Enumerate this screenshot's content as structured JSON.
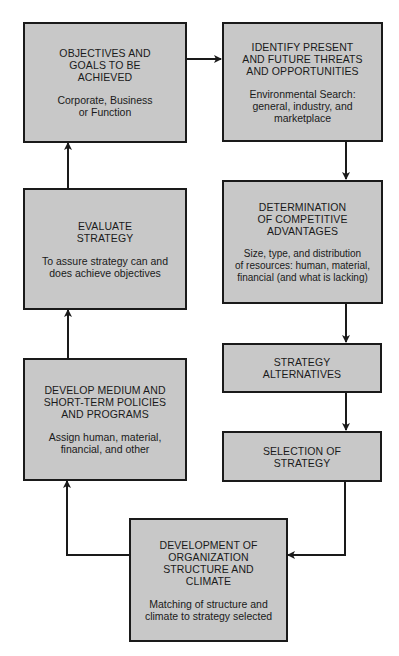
{
  "diagram": {
    "type": "flowchart",
    "colors": {
      "box_fill": "#c8c8c8",
      "stroke": "#1a1a1a",
      "background": "#ffffff"
    },
    "nodes": [
      {
        "id": "objectives",
        "title": "OBJECTIVES AND\nGOALS TO BE\nACHIEVED",
        "description": "Corporate, Business\nor Function"
      },
      {
        "id": "identify",
        "title": "IDENTIFY PRESENT\nAND FUTURE THREATS\nAND OPPORTUNITIES",
        "description": "Environmental Search:\ngeneral, industry, and\nmarketplace"
      },
      {
        "id": "determination",
        "title": "DETERMINATION\nOF COMPETITIVE\nADVANTAGES",
        "description": "Size, type, and distribution\nof resources: human, material,\nfinancial (and what is lacking)"
      },
      {
        "id": "alternatives",
        "title": "STRATEGY\nALTERNATIVES",
        "description": ""
      },
      {
        "id": "selection",
        "title": "SELECTION OF\nSTRATEGY",
        "description": ""
      },
      {
        "id": "organization",
        "title": "DEVELOPMENT OF\nORGANIZATION\nSTRUCTURE AND\nCLIMATE",
        "description": "Matching of structure and\nclimate to strategy selected"
      },
      {
        "id": "policies",
        "title": "DEVELOP MEDIUM AND\nSHORT-TERM POLICIES\nAND PROGRAMS",
        "description": "Assign human, material,\nfinancial, and other"
      },
      {
        "id": "evaluate",
        "title": "EVALUATE\nSTRATEGY",
        "description": "To assure strategy can and\ndoes achieve objectives"
      }
    ],
    "edges": [
      {
        "from": "objectives",
        "to": "identify"
      },
      {
        "from": "identify",
        "to": "determination"
      },
      {
        "from": "determination",
        "to": "alternatives"
      },
      {
        "from": "alternatives",
        "to": "selection"
      },
      {
        "from": "selection",
        "to": "organization"
      },
      {
        "from": "organization",
        "to": "policies"
      },
      {
        "from": "policies",
        "to": "evaluate"
      },
      {
        "from": "evaluate",
        "to": "objectives"
      }
    ]
  }
}
